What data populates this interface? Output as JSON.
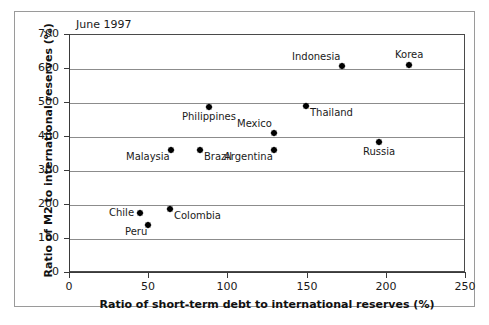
{
  "chart_data": {
    "type": "scatter",
    "title": "June 1997",
    "xlabel": "Ratio of short-term debt to international reserves (%)",
    "ylabel": "Ratio of M2 to international reserves (%)",
    "xlim": [
      0,
      250
    ],
    "ylim": [
      0,
      700
    ],
    "xticks": [
      0,
      50,
      100,
      150,
      200,
      250
    ],
    "yticks": [
      0,
      100,
      200,
      300,
      400,
      500,
      600,
      700
    ],
    "grid": "horizontal",
    "legend": "none",
    "marker": "diamond",
    "marker_color": "#000000",
    "points": [
      {
        "label": "Indonesia",
        "x": 172,
        "y": 610,
        "label_pos": "above-left"
      },
      {
        "label": "Korea",
        "x": 214,
        "y": 612,
        "label_pos": "above"
      },
      {
        "label": "Philippines",
        "x": 88,
        "y": 488,
        "label_pos": "below"
      },
      {
        "label": "Thailand",
        "x": 149,
        "y": 490,
        "label_pos": "below-right"
      },
      {
        "label": "Mexico",
        "x": 129,
        "y": 413,
        "label_pos": "above-left"
      },
      {
        "label": "Russia",
        "x": 195,
        "y": 385,
        "label_pos": "below"
      },
      {
        "label": "Malaysia",
        "x": 64,
        "y": 363,
        "label_pos": "below-left"
      },
      {
        "label": "Brazil",
        "x": 82,
        "y": 362,
        "label_pos": "below-right"
      },
      {
        "label": "Argentina",
        "x": 129,
        "y": 362,
        "label_pos": "below-left"
      },
      {
        "label": "Colombia",
        "x": 63,
        "y": 187,
        "label_pos": "below-right"
      },
      {
        "label": "Chile",
        "x": 44,
        "y": 177,
        "label_pos": "left"
      },
      {
        "label": "Peru",
        "x": 49,
        "y": 142,
        "label_pos": "below-left"
      }
    ]
  }
}
